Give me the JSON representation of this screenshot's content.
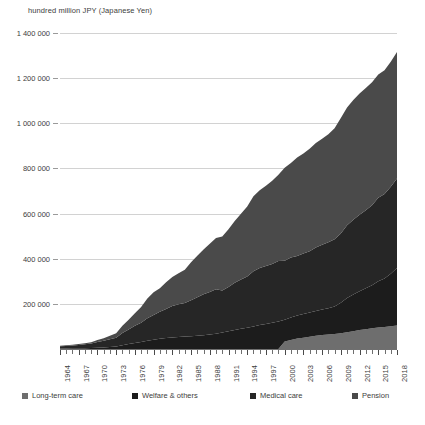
{
  "axis_title": "hundred million JPY (Japanese Yen)",
  "legend": [
    {
      "label": "Long-term care",
      "color": "#6e6e6e",
      "left": 0
    },
    {
      "label": "Welfare & others",
      "color": "#1c1c1c",
      "left": 110
    },
    {
      "label": "Medical care",
      "color": "#262626",
      "left": 228
    },
    {
      "label": "Pension",
      "color": "#4a4a4a",
      "left": 330
    }
  ],
  "caption": "",
  "chart_data": {
    "type": "area",
    "stacked": true,
    "title": "",
    "subtitle": "",
    "xlabel": "",
    "ylabel": "hundred million JPY (Japanese Yen)",
    "ylim": [
      0,
      1400000
    ],
    "yticks": [
      200000,
      400000,
      600000,
      800000,
      1000000,
      1200000,
      1400000
    ],
    "ytick_labels": [
      "200 000",
      "400 000",
      "600 000",
      "800 000",
      "1 000 000",
      "1 200 000",
      "1 400 000"
    ],
    "grid": true,
    "legend_position": "bottom",
    "x": [
      1964,
      1965,
      1966,
      1967,
      1968,
      1969,
      1970,
      1971,
      1972,
      1973,
      1974,
      1975,
      1976,
      1977,
      1978,
      1979,
      1980,
      1981,
      1982,
      1983,
      1984,
      1985,
      1986,
      1987,
      1988,
      1989,
      1990,
      1991,
      1992,
      1993,
      1994,
      1995,
      1996,
      1997,
      1998,
      1999,
      2000,
      2001,
      2002,
      2003,
      2004,
      2005,
      2006,
      2007,
      2008,
      2009,
      2010,
      2011,
      2012,
      2013,
      2014,
      2015,
      2016,
      2017,
      2018
    ],
    "xtick_labels": [
      "1964",
      "1967",
      "1970",
      "1973",
      "1976",
      "1979",
      "1982",
      "1985",
      "1988",
      "1991",
      "1994",
      "1997",
      "2000",
      "2003",
      "2006",
      "2009",
      "2012",
      "2015",
      "2018"
    ],
    "xtick_step": 3,
    "series": [
      {
        "name": "Long-term care",
        "color": "#6e6e6e",
        "values": [
          0,
          0,
          0,
          0,
          0,
          0,
          0,
          0,
          0,
          0,
          0,
          0,
          0,
          0,
          0,
          0,
          0,
          0,
          0,
          0,
          0,
          0,
          0,
          0,
          0,
          0,
          0,
          0,
          0,
          0,
          0,
          0,
          0,
          0,
          0,
          0,
          32806,
          40409,
          46125,
          50314,
          54659,
          58701,
          61718,
          64311,
          66661,
          70199,
          74106,
          78831,
          83965,
          87879,
          91896,
          95060,
          97064,
          101020,
          103872
        ]
      },
      {
        "name": "Welfare & others",
        "color": "#1c1c1c",
        "values": [
          2254,
          2544,
          2963,
          3376,
          3823,
          4345,
          5911,
          7093,
          8775,
          10972,
          16831,
          21824,
          26228,
          30578,
          36338,
          40803,
          45096,
          48880,
          51412,
          53297,
          54840,
          56358,
          58338,
          61260,
          64216,
          67598,
          73125,
          78321,
          83686,
          89222,
          94525,
          100209,
          106207,
          110861,
          116152,
          122331,
          96241,
          99074,
          102044,
          104765,
          106952,
          110157,
          112827,
          116111,
          121269,
          135000,
          152000,
          163000,
          172000,
          181000,
          190000,
          205000,
          215000,
          232000,
          255000
        ]
      },
      {
        "name": "Medical care",
        "color": "#262626",
        "values": [
          10105,
          11224,
          12901,
          14843,
          17018,
          19625,
          24962,
          29433,
          34760,
          39280,
          53786,
          64779,
          76684,
          85686,
          100042,
          109510,
          119805,
          128709,
          138659,
          144646,
          148662,
          160159,
          170690,
          180759,
          188601,
          197290,
          186254,
          196295,
          209545,
          218260,
          226624,
          244600,
          253000,
          257000,
          260000,
          268000,
          262000,
          266000,
          264000,
          268000,
          272000,
          281000,
          287000,
          293000,
          298000,
          307000,
          322000,
          331000,
          339000,
          346000,
          355000,
          370000,
          375000,
          386000,
          397000
        ]
      },
      {
        "name": "Pension",
        "color": "#4a4a4a",
        "values": [
          2025,
          2502,
          3115,
          3851,
          4662,
          5696,
          8562,
          11120,
          14660,
          19490,
          32245,
          43000,
          56000,
          70000,
          87000,
          101000,
          104000,
          118000,
          129000,
          138000,
          148000,
          168000,
          184000,
          199000,
          213000,
          227000,
          239000,
          256000,
          274000,
          292000,
          310000,
          332000,
          344000,
          355000,
          369000,
          382000,
          412000,
          419000,
          436000,
          443000,
          454000,
          463000,
          470000,
          478000,
          492000,
          511000,
          522000,
          530000,
          537000,
          542000,
          545000,
          546000,
          548000,
          554000,
          560000
        ]
      }
    ],
    "totals_note": "Stacking order bottom to top: Long-term care, Welfare & others, Medical care, Pension"
  }
}
